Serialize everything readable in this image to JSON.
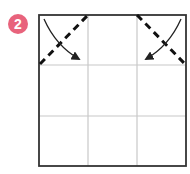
{
  "step": {
    "number": "2",
    "badge_color": "#e8637c"
  },
  "diagram": {
    "type": "origami-fold-step",
    "grid": {
      "rows": 3,
      "cols": 3
    },
    "square": {
      "x": 39,
      "y": 15,
      "width": 147,
      "height": 151
    },
    "colors": {
      "outline": "#333333",
      "grid": "#c8c8c8",
      "fold": "#111111",
      "arrow": "#222222"
    },
    "folds": [
      {
        "name": "top-left-corner-fold",
        "style": "dashed",
        "from": [
          39,
          65
        ],
        "to": [
          88,
          15
        ]
      },
      {
        "name": "top-right-corner-fold",
        "style": "dashed",
        "from": [
          137,
          15
        ],
        "to": [
          186,
          65
        ]
      }
    ],
    "arrows": [
      {
        "name": "fold-arrow-left",
        "from": [
          44,
          19
        ],
        "to": [
          79,
          59
        ]
      },
      {
        "name": "fold-arrow-right",
        "from": [
          181,
          19
        ],
        "to": [
          146,
          59
        ]
      }
    ]
  }
}
